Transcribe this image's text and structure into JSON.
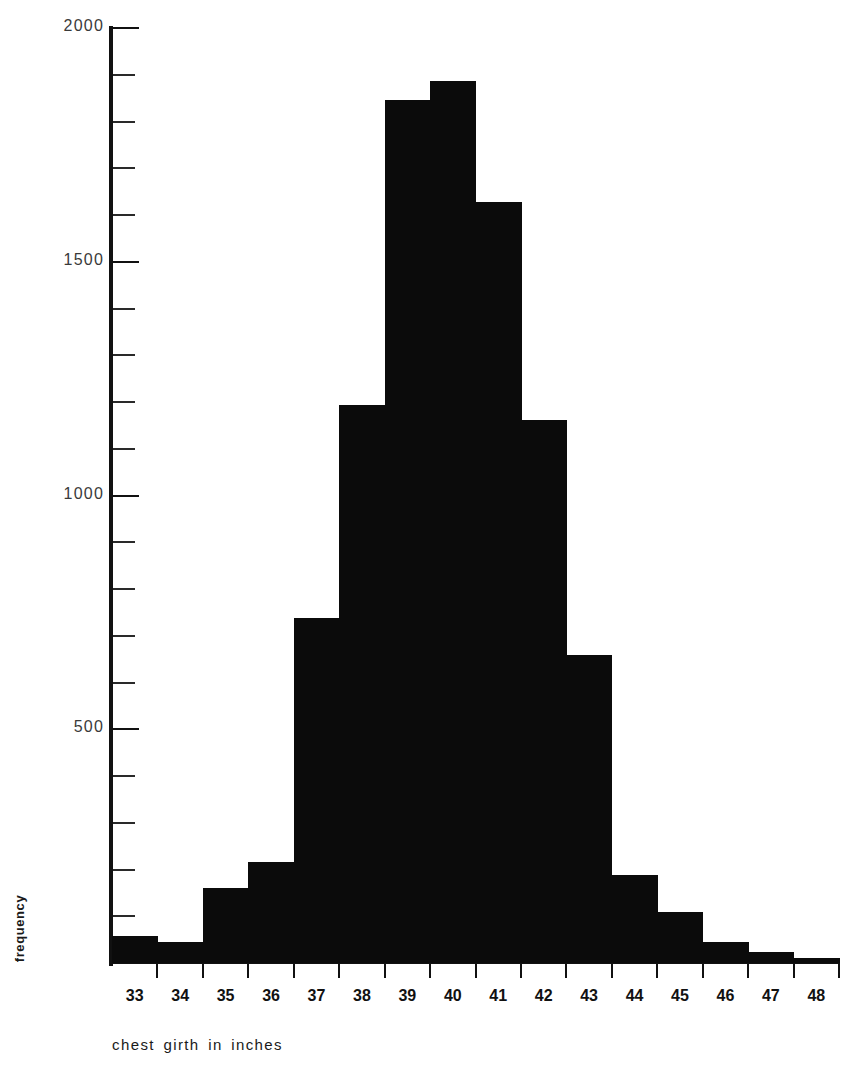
{
  "chart_data": {
    "type": "bar",
    "title": "",
    "subtitle": "",
    "xlabel": "chest girth in inches",
    "ylabel": "frequency",
    "categories": [
      "33",
      "34",
      "35",
      "36",
      "37",
      "38",
      "39",
      "40",
      "41",
      "42",
      "43",
      "44",
      "45",
      "46",
      "47",
      "48"
    ],
    "values": [
      3,
      18,
      81,
      185,
      420,
      749,
      1073,
      1079,
      934,
      658,
      370,
      92,
      50,
      21,
      4,
      1
    ],
    "bar_pixel_values": [
      57,
      45,
      160,
      216,
      738,
      1194,
      1847,
      1886,
      1628,
      1162,
      659,
      188,
      109,
      45,
      23,
      11
    ],
    "x_tick_labels": [
      "33",
      "34",
      "35",
      "36",
      "37",
      "38",
      "39",
      "40",
      "41",
      "42",
      "43",
      "44",
      "45",
      "46",
      "47",
      "48"
    ],
    "y_tick_labels": [
      "500",
      "1000",
      "1500",
      "2000"
    ],
    "y_major_values": [
      500,
      1000,
      1500,
      2000
    ],
    "y_minor_step": 100,
    "ylim": [
      0,
      2000
    ],
    "xlim": [
      33,
      48
    ],
    "grid": false,
    "legend": null,
    "legend_position": "none",
    "bar_color": "#0b0b0b",
    "axis_color": "#111111",
    "background_color": "#ffffff"
  },
  "axes": {
    "y_axis_name": "frequency-axis",
    "x_axis_name": "chest-girth-axis"
  }
}
